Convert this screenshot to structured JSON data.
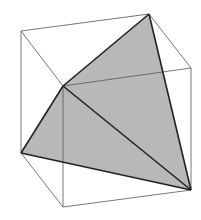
{
  "diagram": {
    "colors": {
      "background": "#ffffff",
      "cube_edge": "#555555",
      "tetra_edge": "#222222",
      "tetra_fill": "#b8b8b8"
    },
    "cube_vertices": {
      "A": [
        21,
        31
      ],
      "B": [
        149,
        14
      ],
      "C": [
        191,
        68
      ],
      "D": [
        63,
        86
      ],
      "E": [
        21,
        153
      ],
      "F": [
        63,
        207
      ],
      "G": [
        191,
        190
      ]
    },
    "tetrahedron_vertices": [
      "B",
      "D",
      "E",
      "G"
    ]
  }
}
